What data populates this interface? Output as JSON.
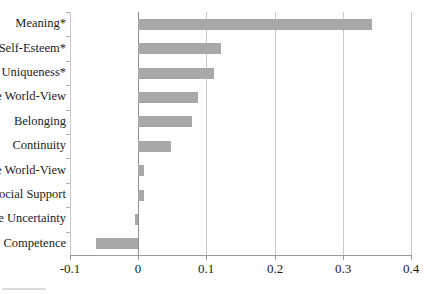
{
  "chart_data": {
    "type": "bar",
    "orientation": "horizontal",
    "title": "",
    "xlabel": "",
    "ylabel": "",
    "categories": [
      "Meaning*",
      "Self-Esteem*",
      "Uniqueness*",
      "Validate World-View",
      "Belonging",
      "Continuity",
      "Provide World-View",
      "Social Support",
      "Reduce Uncertainty",
      "Competence"
    ],
    "values": [
      0.343,
      0.122,
      0.111,
      0.088,
      0.079,
      0.048,
      0.009,
      0.009,
      -0.004,
      -0.062
    ],
    "xlim": [
      -0.1,
      0.4
    ],
    "xticks": [
      -0.1,
      0,
      0.1,
      0.2,
      0.3,
      0.4
    ],
    "xtick_labels": [
      "-0.1",
      "0",
      "0.1",
      "0.2",
      "0.3",
      "0.4"
    ],
    "grid": true,
    "grid_axis": "x",
    "legend": null,
    "bar_color": "#a8a8a8",
    "axis_color": "#9a9a9a",
    "grid_color": "#c9c9c9"
  }
}
